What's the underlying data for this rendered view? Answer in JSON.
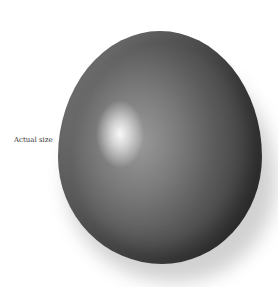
{
  "caption": "Actual size",
  "image": {
    "subject": "egg",
    "description": "Grey glossy egg with specular highlight upper-left and soft drop shadow lower-right"
  }
}
